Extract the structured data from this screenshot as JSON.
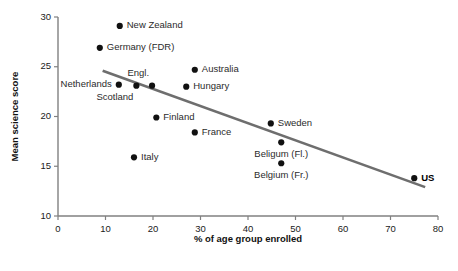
{
  "chart_data": {
    "type": "scatter",
    "title": "",
    "xlabel": "% of age group enrolled",
    "ylabel": "Mean science score",
    "xlim": [
      0,
      80
    ],
    "ylim": [
      10,
      30
    ],
    "xticks": [
      0,
      10,
      20,
      30,
      40,
      50,
      60,
      70,
      80
    ],
    "yticks": [
      10,
      15,
      20,
      25,
      30
    ],
    "xtick_labels": [
      "0",
      "10",
      "20",
      "30",
      "40",
      "50",
      "60",
      "70",
      "80"
    ],
    "ytick_labels": [
      "10",
      "15",
      "20",
      "25",
      "30"
    ],
    "grid": false,
    "legend": false,
    "legend_position": "none",
    "point_color": "#111111",
    "trendline_color": "#6e6e6e",
    "axis_color": "#808080",
    "points": [
      {
        "label": "New Zealand",
        "x": 13.0,
        "y": 29.1,
        "label_side": "right",
        "bold": false
      },
      {
        "label": "Germany (FDR)",
        "x": 8.8,
        "y": 26.9,
        "label_side": "right",
        "bold": false
      },
      {
        "label": "Australia",
        "x": 28.8,
        "y": 24.7,
        "label_side": "right",
        "bold": false
      },
      {
        "label": "Netherlands",
        "x": 12.8,
        "y": 23.2,
        "label_side": "left",
        "bold": false
      },
      {
        "label": "Scotland",
        "x": 16.5,
        "y": 23.1,
        "label_side": "below-left",
        "bold": false
      },
      {
        "label": "Engl.",
        "x": 19.8,
        "y": 23.1,
        "label_side": "above-left",
        "bold": false
      },
      {
        "label": "Hungary",
        "x": 27.0,
        "y": 23.0,
        "label_side": "right",
        "bold": false
      },
      {
        "label": "Finland",
        "x": 20.7,
        "y": 19.9,
        "label_side": "right",
        "bold": false
      },
      {
        "label": "Sweden",
        "x": 44.8,
        "y": 19.3,
        "label_side": "right",
        "bold": false
      },
      {
        "label": "France",
        "x": 28.8,
        "y": 18.4,
        "label_side": "right",
        "bold": false
      },
      {
        "label": "Beligum (Fl.)",
        "x": 47.0,
        "y": 17.4,
        "label_side": "below",
        "bold": false
      },
      {
        "label": "Italy",
        "x": 16.0,
        "y": 15.9,
        "label_side": "right",
        "bold": false
      },
      {
        "label": "Belgium (Fr.)",
        "x": 47.0,
        "y": 15.3,
        "label_side": "below",
        "bold": false
      },
      {
        "label": "US",
        "x": 75.0,
        "y": 13.8,
        "label_side": "right",
        "bold": true
      }
    ],
    "trendline": {
      "x0": 9.4,
      "y0": 24.6,
      "x1": 77.3,
      "y1": 12.9
    }
  }
}
